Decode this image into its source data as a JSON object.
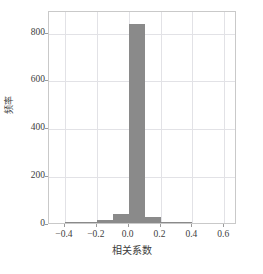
{
  "chart_data": {
    "type": "bar",
    "title": "",
    "subtitle": "",
    "xlabel": "相关系数",
    "ylabel": "频率",
    "xlim": [
      -0.5,
      0.68
    ],
    "ylim": [
      0,
      890
    ],
    "grid": true,
    "legend": false,
    "bin_width": 0.1,
    "bar_color": "#8a8a8a",
    "grid_color": "#e2e2e6",
    "frame_color": "#c9c9c9",
    "categories": [
      "-0.45",
      "-0.35",
      "-0.25",
      "-0.15",
      "-0.05",
      "0.05",
      "0.15",
      "0.25",
      "0.35",
      "0.45",
      "0.55"
    ],
    "bin_edges": [
      -0.5,
      -0.4,
      -0.3,
      -0.2,
      -0.1,
      0.0,
      0.1,
      0.2,
      0.3,
      0.4,
      0.5,
      0.6
    ],
    "values": [
      0,
      4,
      4,
      14,
      38,
      831,
      25,
      6,
      3,
      0,
      0
    ],
    "xticks": [
      {
        "value": -0.4,
        "label": "−0.4"
      },
      {
        "value": -0.2,
        "label": "−0.2"
      },
      {
        "value": 0.0,
        "label": "0.0"
      },
      {
        "value": 0.2,
        "label": "0.2"
      },
      {
        "value": 0.4,
        "label": "0.4"
      },
      {
        "value": 0.6,
        "label": "0.6"
      }
    ],
    "yticks": [
      {
        "value": 0,
        "label": "0"
      },
      {
        "value": 200,
        "label": "200"
      },
      {
        "value": 400,
        "label": "400"
      },
      {
        "value": 600,
        "label": "600"
      },
      {
        "value": 800,
        "label": "800"
      }
    ]
  },
  "caption": {
    "text": ""
  }
}
